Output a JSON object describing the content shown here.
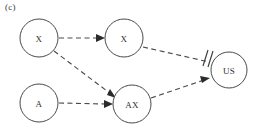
{
  "figure": {
    "panel_label": "(c)",
    "width": 255,
    "height": 130,
    "background": "#ffffff",
    "stroke_color": "#4a4a4a",
    "text_color": "#2e2e2e"
  },
  "nodes": [
    {
      "id": "x-exposure",
      "label": "X",
      "cx": 39,
      "cy": 38,
      "r": 19
    },
    {
      "id": "x-mediator",
      "label": "X",
      "cx": 124,
      "cy": 38,
      "r": 19
    },
    {
      "id": "a-baseline",
      "label": "A",
      "cx": 39,
      "cy": 103,
      "r": 19
    },
    {
      "id": "ax-interaction",
      "label": "AX",
      "cx": 132,
      "cy": 104,
      "r": 19
    },
    {
      "id": "us-outcome",
      "label": "US",
      "cx": 229,
      "cy": 70,
      "r": 18
    }
  ],
  "edges": [
    {
      "id": "x-to-x",
      "from": "X",
      "to": "X",
      "style": "dashed",
      "ending": "arrow"
    },
    {
      "id": "x-to-ax",
      "from": "X",
      "to": "AX",
      "style": "dashed",
      "ending": "arrow"
    },
    {
      "id": "a-to-ax",
      "from": "A",
      "to": "AX",
      "style": "dashed",
      "ending": "arrow"
    },
    {
      "id": "ax-to-us",
      "from": "AX",
      "to": "US",
      "style": "dashed",
      "ending": "arrow"
    },
    {
      "id": "x-to-us",
      "from": "X",
      "to": "US",
      "style": "dashed",
      "ending": "blocked-double-slash"
    }
  ]
}
